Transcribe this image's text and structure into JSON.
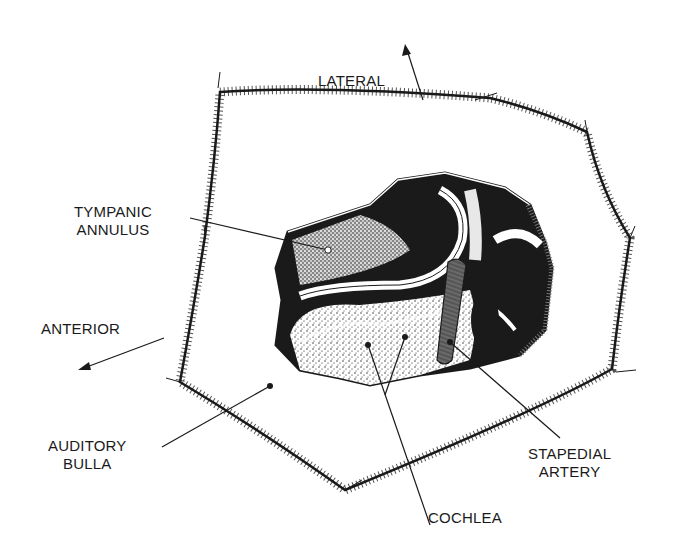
{
  "figure": {
    "type": "anatomical-line-drawing",
    "colors": {
      "ink": "#1a1a1a",
      "background": "#ffffff",
      "artery": "#6a6a6a"
    }
  },
  "orientation": {
    "lateral": {
      "label": "LATERAL",
      "direction": "up"
    },
    "anterior": {
      "label": "ANTERIOR",
      "direction": "down-left"
    }
  },
  "labels": {
    "tympanic_annulus": {
      "line1": "TYMPANIC",
      "line2": "ANNULUS"
    },
    "auditory_bulla": {
      "line1": "AUDITORY",
      "line2": "BULLA"
    },
    "cochlea": {
      "line1": "COCHLEA"
    },
    "stapedial_artery": {
      "line1": "STAPEDIAL",
      "line2": "ARTERY"
    }
  }
}
